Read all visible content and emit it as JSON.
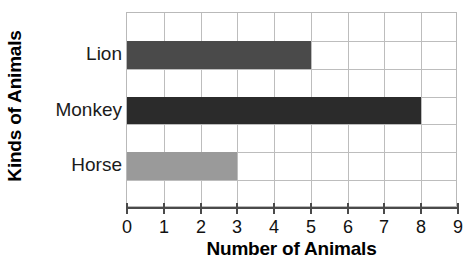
{
  "chart_data": {
    "type": "bar",
    "orientation": "horizontal",
    "title": "",
    "categories": [
      "Lion",
      "Monkey",
      "Horse"
    ],
    "values": [
      5,
      8,
      3
    ],
    "xlabel": "Number of Animals",
    "ylabel": "Kinds of Animals",
    "xlim": [
      0,
      9
    ],
    "xticks": [
      "0",
      "1",
      "2",
      "3",
      "4",
      "5",
      "6",
      "7",
      "8",
      "9"
    ],
    "grid": true,
    "legend": "none",
    "bar_colors": [
      "#4a4a4a",
      "#2b2b2b",
      "#9a9a9a"
    ],
    "bars": [
      {
        "category": "Lion",
        "value": 5,
        "color": "#4a4a4a"
      },
      {
        "category": "Monkey",
        "value": 8,
        "color": "#2b2b2b"
      },
      {
        "category": "Horse",
        "value": 3,
        "color": "#9a9a9a"
      }
    ]
  },
  "axis": {
    "x_title": "Number of Animals",
    "y_title": "Kinds of Animals"
  },
  "colors": {
    "grid": "#bdbdbd",
    "axis": "#4a4a4a",
    "text": "#111111",
    "background": "#ffffff"
  }
}
